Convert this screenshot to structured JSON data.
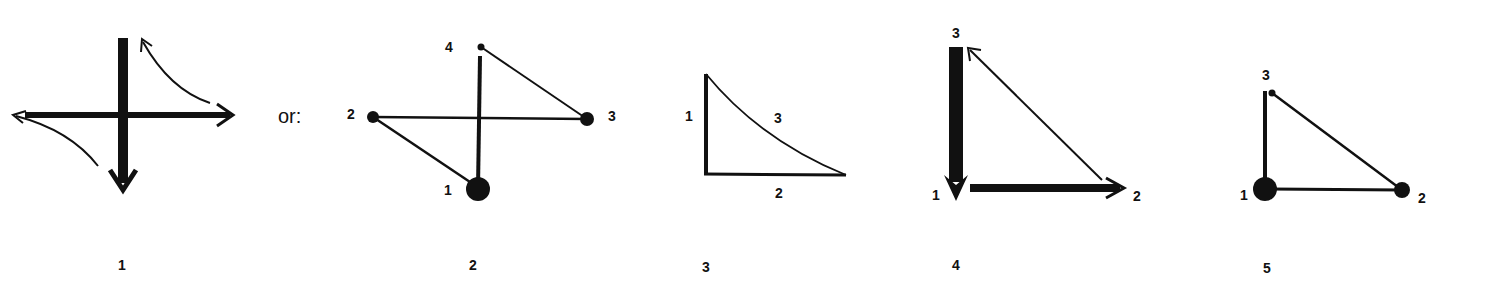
{
  "figures": [
    {
      "id": 1,
      "caption": "1",
      "description": "thick vertical arrow pointing down crossing thick horizontal arrow pointing right, with thin curved arrows in top-right and bottom-left quadrants",
      "separator_text": "or:"
    },
    {
      "id": 2,
      "caption": "2",
      "nodes": [
        {
          "label": "1",
          "size": "large"
        },
        {
          "label": "2",
          "size": "small"
        },
        {
          "label": "3",
          "size": "medium"
        },
        {
          "label": "4",
          "size": "tiny"
        }
      ]
    },
    {
      "id": 3,
      "caption": "3",
      "edges": [
        {
          "label": "1",
          "weight": "thick"
        },
        {
          "label": "2",
          "weight": "medium"
        },
        {
          "label": "3",
          "weight": "thin-curved"
        }
      ]
    },
    {
      "id": 4,
      "caption": "4",
      "vertices": [
        {
          "label": "1"
        },
        {
          "label": "2"
        },
        {
          "label": "3"
        }
      ]
    },
    {
      "id": 5,
      "caption": "5",
      "nodes": [
        {
          "label": "1",
          "size": "large"
        },
        {
          "label": "2",
          "size": "medium"
        },
        {
          "label": "3",
          "size": "tiny"
        }
      ]
    }
  ],
  "colors": {
    "ink": "#111111",
    "background": "#ffffff"
  }
}
